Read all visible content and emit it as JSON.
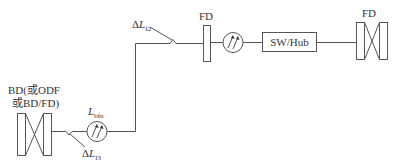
{
  "labels": {
    "bd_line1": "BD(或ODF",
    "bd_line2": "或BD/FD)",
    "fd_mid": "FD",
    "fd_right": "FD",
    "switch": "SW/Hub",
    "delta_f2_prefix": "Δ",
    "delta_f2_var": "L",
    "delta_f2_sub": "f2",
    "delta_f3_prefix": "Δ",
    "delta_f3_var": "L",
    "delta_f3_sub": "f3",
    "lbfn_var": "L",
    "lbfn_sub": "bfn"
  }
}
